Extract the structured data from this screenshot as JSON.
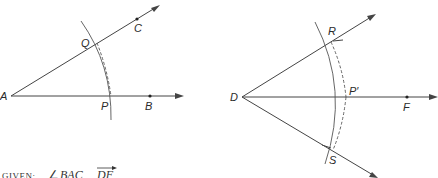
{
  "figure": {
    "left": {
      "title": "Angle BAC construction",
      "points": {
        "A": {
          "label": "A"
        },
        "Q": {
          "label": "Q"
        },
        "C": {
          "label": "C"
        },
        "P": {
          "label": "P"
        },
        "B": {
          "label": "B"
        }
      }
    },
    "right": {
      "title": "Ray DF construction",
      "points": {
        "D": {
          "label": "D"
        },
        "R": {
          "label": "R"
        },
        "P_prime": {
          "label": "P′"
        },
        "F": {
          "label": "F"
        },
        "S": {
          "label": "S"
        }
      }
    },
    "given": {
      "prefix": "GIVEN:",
      "angle_symbol": "∠",
      "angle": "BAC,",
      "ray": "DF"
    }
  },
  "colors": {
    "stroke": "#444444",
    "background": "#ffffff"
  }
}
